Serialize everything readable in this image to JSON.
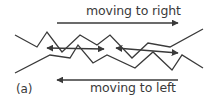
{
  "figure": {
    "panel_label": "(a)",
    "top_arrow": {
      "label": "moving to right",
      "direction": "right"
    },
    "bottom_arrow": {
      "label": "moving to left",
      "direction": "left"
    },
    "line_color": "#3a3a3a",
    "background": "#ffffff",
    "zigzag_lines": [
      {
        "name": "upper-zigzag",
        "points": [
          [
            15,
            35
          ],
          [
            37,
            47
          ],
          [
            47,
            32
          ],
          [
            62,
            52
          ],
          [
            80,
            35
          ],
          [
            97,
            45
          ],
          [
            110,
            35
          ],
          [
            132,
            58
          ],
          [
            148,
            43
          ],
          [
            170,
            47
          ],
          [
            203,
            29
          ]
        ]
      },
      {
        "name": "lower-zigzag",
        "points": [
          [
            15,
            73
          ],
          [
            50,
            55
          ],
          [
            70,
            58
          ],
          [
            78,
            45
          ],
          [
            93,
            63
          ],
          [
            107,
            55
          ],
          [
            135,
            68
          ],
          [
            153,
            52
          ],
          [
            172,
            70
          ],
          [
            182,
            55
          ],
          [
            203,
            68
          ]
        ]
      }
    ],
    "double_arrows": [
      {
        "name": "double-arrow-left",
        "from": [
          47,
          48
        ],
        "to": [
          104,
          49
        ]
      },
      {
        "name": "double-arrow-right",
        "from": [
          116,
          48
        ],
        "to": [
          178,
          53
        ]
      }
    ]
  }
}
